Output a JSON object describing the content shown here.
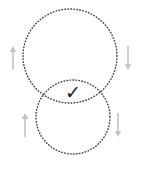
{
  "canvas": {
    "width": 141,
    "height": 172,
    "background_color": "#ffffff"
  },
  "diagram": {
    "type": "venn-overlap",
    "stroke_color": "#3a3a3a",
    "shapes": [
      {
        "name": "top-circle",
        "cx": 70,
        "cy": 56,
        "r": 47,
        "stroke_color": "#3a3a3a",
        "stroke_width": 1.4,
        "dash": "0.6 2.4",
        "fill": "none"
      },
      {
        "name": "bottom-circle",
        "cx": 73,
        "cy": 117,
        "r": 37,
        "stroke_color": "#3a3a3a",
        "stroke_width": 1.4,
        "dash": "0.6 2.4",
        "fill": "none"
      }
    ],
    "check_mark": {
      "glyph": "✓",
      "x": 73,
      "y": 99,
      "font_size": 19,
      "color": "#1c1c1c"
    },
    "arrows": [
      {
        "name": "arrow-top-left",
        "direction": "up",
        "x": 13,
        "y_top": 46,
        "y_bottom": 70,
        "color": "#c2c2c2"
      },
      {
        "name": "arrow-top-right",
        "direction": "down",
        "x": 128,
        "y_top": 46,
        "y_bottom": 70,
        "color": "#c2c2c2"
      },
      {
        "name": "arrow-bottom-left",
        "direction": "up",
        "x": 25,
        "y_top": 113,
        "y_bottom": 137,
        "color": "#c2c2c2"
      },
      {
        "name": "arrow-bottom-right",
        "direction": "down",
        "x": 118,
        "y_top": 113,
        "y_bottom": 137,
        "color": "#c2c2c2"
      }
    ]
  }
}
